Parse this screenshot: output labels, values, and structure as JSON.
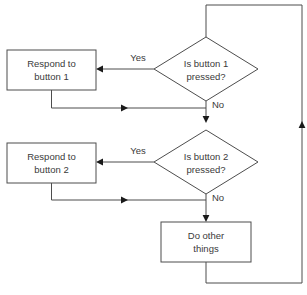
{
  "diagram": {
    "type": "flowchart",
    "background_color": "#ffffff",
    "line_color": "#4d4d4d",
    "text_color": "#3a3a3a",
    "arrow_color": "#1a1a1a"
  },
  "nodes": {
    "respond1": {
      "shape": "process",
      "line1": "Respond to",
      "line2": "button 1",
      "x": 7,
      "y": 50,
      "w": 89,
      "h": 40
    },
    "decision1": {
      "shape": "decision",
      "line1": "Is button  1",
      "line2": "pressed?",
      "cx": 206,
      "cy": 69,
      "rx": 52,
      "ry": 32
    },
    "respond2": {
      "shape": "process",
      "line1": "Respond to",
      "line2": "button 2",
      "x": 7,
      "y": 143,
      "w": 89,
      "h": 40
    },
    "decision2": {
      "shape": "decision",
      "line1": "Is button  2",
      "line2": "pressed?",
      "cx": 206,
      "cy": 162,
      "rx": 52,
      "ry": 32
    },
    "dootherthings": {
      "shape": "process",
      "line1": "Do other",
      "line2": "things",
      "x": 161,
      "y": 222,
      "w": 90,
      "h": 40
    }
  },
  "edge_labels": {
    "yes1": "Yes",
    "no1": "No",
    "yes2": "Yes",
    "no2": "No"
  },
  "edges": [
    {
      "name": "loop-top-to-decision1",
      "from": "loop",
      "to": "decision1"
    },
    {
      "name": "decision1-yes-to-respond1",
      "from": "decision1",
      "to": "respond1",
      "label": "Yes"
    },
    {
      "name": "decision1-no-to-decision2",
      "from": "decision1",
      "to": "decision2",
      "label": "No"
    },
    {
      "name": "respond1-to-merge1",
      "from": "respond1",
      "to": "merge1"
    },
    {
      "name": "decision2-yes-to-respond2",
      "from": "decision2",
      "to": "respond2",
      "label": "Yes"
    },
    {
      "name": "decision2-no-to-dootherthings",
      "from": "decision2",
      "to": "dootherthings",
      "label": "No"
    },
    {
      "name": "respond2-to-merge2",
      "from": "respond2",
      "to": "merge2"
    },
    {
      "name": "dootherthings-to-loop",
      "from": "dootherthings",
      "to": "loop"
    }
  ]
}
